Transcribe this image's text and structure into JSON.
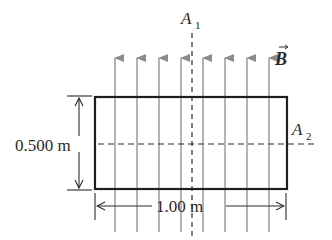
{
  "diagram": {
    "type": "rectangular loop in uniform magnetic field",
    "field": {
      "label": "B",
      "vector": true,
      "direction": "up",
      "line_color": "#8c8c8c",
      "line_x": [
        115,
        137,
        159,
        181,
        203,
        225,
        247,
        269
      ]
    },
    "loop": {
      "stroke_color": "#1e1e1e",
      "width_label": "1.00 m",
      "height_label": "0.500 m"
    },
    "axes": [
      {
        "name": "A",
        "subscript": "1",
        "orientation": "vertical"
      },
      {
        "name": "A",
        "subscript": "2",
        "orientation": "horizontal"
      }
    ]
  }
}
